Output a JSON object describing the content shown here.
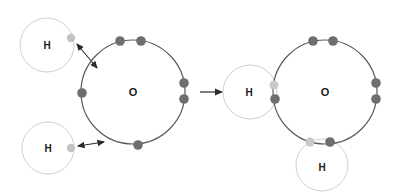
{
  "diagram": {
    "background_color": "#ffffff",
    "colors": {
      "oxygen_shell_stroke": "#5a5a5a",
      "hydrogen_shell_stroke": "#cfcfcf",
      "oxygen_electron": "#6e6e6e",
      "hydrogen_electron": "#c4c4c4",
      "arrow": "#2a2a2a",
      "label_text": "#1a1a1a"
    },
    "reactants": {
      "oxygen": {
        "label": "O",
        "center": {
          "x": 133,
          "y": 92
        },
        "shell_radius": 52,
        "electron_count": 6,
        "electrons": [
          {
            "name": "o-electron-top-left",
            "x": 120,
            "y": 41,
            "owner": "oxygen"
          },
          {
            "name": "o-electron-top-right",
            "x": 141,
            "y": 41,
            "owner": "oxygen"
          },
          {
            "name": "o-electron-right-upper",
            "x": 184,
            "y": 83,
            "owner": "oxygen"
          },
          {
            "name": "o-electron-right-lower",
            "x": 184,
            "y": 99,
            "owner": "oxygen"
          },
          {
            "name": "o-electron-left",
            "x": 82,
            "y": 93,
            "owner": "oxygen"
          },
          {
            "name": "o-electron-bottom",
            "x": 138,
            "y": 145,
            "owner": "oxygen"
          }
        ]
      },
      "hydrogens": [
        {
          "label": "H",
          "name": "hydrogen-top-left",
          "center": {
            "x": 47,
            "y": 45
          },
          "shell_radius": 27,
          "electron": {
            "name": "h-electron-top-left",
            "x": 71,
            "y": 38,
            "owner": "hydrogen"
          }
        },
        {
          "label": "H",
          "name": "hydrogen-bottom-left",
          "center": {
            "x": 48,
            "y": 148
          },
          "shell_radius": 26,
          "electron": {
            "name": "h-electron-bottom-left",
            "x": 71,
            "y": 148,
            "owner": "hydrogen"
          }
        }
      ],
      "attraction_arrows": [
        {
          "name": "attraction-arrow-upper",
          "x1": 77,
          "y1": 44,
          "x2": 97,
          "y2": 68,
          "double_headed": true
        },
        {
          "name": "attraction-arrow-lower",
          "x1": 78,
          "y1": 146,
          "x2": 104,
          "y2": 142,
          "double_headed": true
        }
      ]
    },
    "reaction_arrow": {
      "name": "reaction-arrow",
      "x1": 200,
      "y1": 92,
      "x2": 222,
      "y2": 92,
      "double_headed": false
    },
    "product": {
      "oxygen": {
        "label": "O",
        "center": {
          "x": 325,
          "y": 92
        },
        "shell_radius": 52,
        "lone_pair_electrons": [
          {
            "name": "o-electron-top-left",
            "x": 313,
            "y": 41,
            "owner": "oxygen"
          },
          {
            "name": "o-electron-top-right",
            "x": 333,
            "y": 41,
            "owner": "oxygen"
          },
          {
            "name": "o-electron-right-upper",
            "x": 376,
            "y": 83,
            "owner": "oxygen"
          },
          {
            "name": "o-electron-right-lower",
            "x": 376,
            "y": 99,
            "owner": "oxygen"
          }
        ]
      },
      "hydrogens": [
        {
          "label": "H",
          "name": "hydrogen-bonded-left",
          "center": {
            "x": 250,
            "y": 92
          },
          "shell_radius": 27
        },
        {
          "label": "H",
          "name": "hydrogen-bonded-bottom",
          "center": {
            "x": 322,
            "y": 165
          },
          "shell_radius": 26
        }
      ],
      "shared_pairs": [
        {
          "name": "shared-pair-left",
          "hydrogen_electron": {
            "name": "shared-h-electron-left",
            "x": 274,
            "y": 85,
            "owner": "hydrogen"
          },
          "oxygen_electron": {
            "name": "shared-o-electron-left",
            "x": 275,
            "y": 99,
            "owner": "oxygen"
          }
        },
        {
          "name": "shared-pair-bottom",
          "hydrogen_electron": {
            "name": "shared-h-electron-bottom",
            "x": 310,
            "y": 142,
            "owner": "hydrogen"
          },
          "oxygen_electron": {
            "name": "shared-o-electron-bottom",
            "x": 330,
            "y": 142,
            "owner": "oxygen"
          }
        }
      ]
    }
  }
}
